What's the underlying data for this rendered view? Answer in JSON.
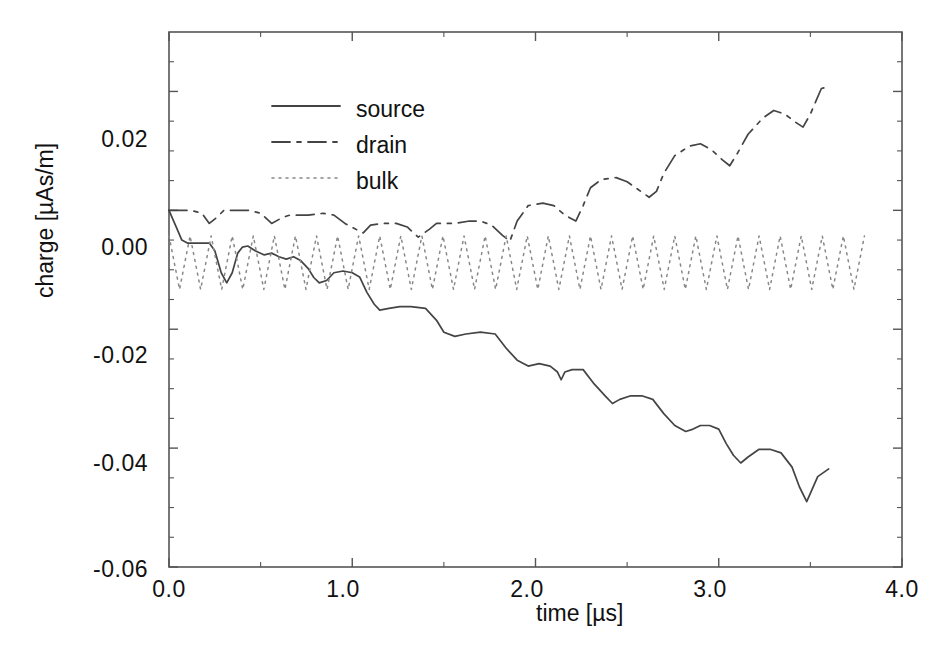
{
  "chart_data": {
    "type": "line",
    "title": "",
    "xlabel": "time [µs]",
    "ylabel": "charge [µAs/m]",
    "xlim": [
      0.0,
      4.0
    ],
    "ylim": [
      -0.06,
      0.03
    ],
    "xticks": [
      "0.0",
      "1.0",
      "2.0",
      "3.0",
      "4.0"
    ],
    "xtick_values": [
      0.0,
      1.0,
      2.0,
      3.0,
      4.0
    ],
    "yticks": [
      "0.02",
      "0.00",
      "-0.02",
      "-0.04",
      "-0.06"
    ],
    "ytick_values": [
      0.02,
      0.0,
      -0.02,
      -0.04,
      -0.06
    ],
    "minor_xtick_values": [
      0.5,
      1.5,
      2.5,
      3.5
    ],
    "minor_ytick_values": [
      0.025,
      0.015,
      0.01,
      0.005,
      -0.005,
      -0.01,
      -0.015,
      -0.025,
      -0.03,
      -0.035,
      -0.045,
      -0.05,
      -0.055
    ],
    "grid": false,
    "legend_position": "upper center",
    "frame_color": "#555555",
    "line_color": "#444444",
    "series": [
      {
        "name": "source",
        "label": "source",
        "style": "solid",
        "dasharray": "",
        "color": "#444444",
        "x": [
          0.0,
          0.035,
          0.07,
          0.1,
          0.22,
          0.25,
          0.285,
          0.315,
          0.345,
          0.375,
          0.4,
          0.43,
          0.47,
          0.52,
          0.56,
          0.6,
          0.64,
          0.68,
          0.72,
          0.76,
          0.79,
          0.82,
          0.86,
          0.9,
          0.95,
          1.0,
          1.04,
          1.08,
          1.12,
          1.15,
          1.2,
          1.26,
          1.32,
          1.4,
          1.46,
          1.5,
          1.56,
          1.62,
          1.7,
          1.78,
          1.84,
          1.9,
          1.96,
          2.02,
          2.08,
          2.12,
          2.14,
          2.16,
          2.2,
          2.26,
          2.32,
          2.38,
          2.42,
          2.46,
          2.52,
          2.58,
          2.64,
          2.7,
          2.76,
          2.82,
          2.86,
          2.9,
          2.95,
          3.0,
          3.04,
          3.08,
          3.12,
          3.16,
          3.22,
          3.28,
          3.34,
          3.4,
          3.44,
          3.48,
          3.54,
          3.6
        ],
        "y": [
          0.0,
          -0.0025,
          -0.005,
          -0.0055,
          -0.0055,
          -0.0068,
          -0.0105,
          -0.0122,
          -0.0105,
          -0.0072,
          -0.0062,
          -0.006,
          -0.0068,
          -0.0075,
          -0.0072,
          -0.0078,
          -0.0082,
          -0.0078,
          -0.0085,
          -0.0098,
          -0.0113,
          -0.0122,
          -0.0118,
          -0.0105,
          -0.0102,
          -0.0105,
          -0.0112,
          -0.0138,
          -0.0158,
          -0.0168,
          -0.0165,
          -0.0162,
          -0.0162,
          -0.0165,
          -0.0185,
          -0.0205,
          -0.0212,
          -0.0208,
          -0.0205,
          -0.0208,
          -0.0232,
          -0.0252,
          -0.0262,
          -0.0258,
          -0.0262,
          -0.0272,
          -0.0285,
          -0.0272,
          -0.0268,
          -0.0268,
          -0.0292,
          -0.0312,
          -0.0325,
          -0.0318,
          -0.0312,
          -0.0312,
          -0.0318,
          -0.0342,
          -0.0362,
          -0.0372,
          -0.0368,
          -0.0362,
          -0.0362,
          -0.0368,
          -0.0392,
          -0.0412,
          -0.0425,
          -0.0415,
          -0.0402,
          -0.0402,
          -0.0408,
          -0.0432,
          -0.0465,
          -0.049,
          -0.0448,
          -0.0435
        ]
      },
      {
        "name": "drain",
        "label": "drain",
        "style": "dashdot",
        "dasharray": "18 7 4 7",
        "color": "#444444",
        "x": [
          0.0,
          0.06,
          0.12,
          0.18,
          0.22,
          0.26,
          0.3,
          0.36,
          0.44,
          0.5,
          0.56,
          0.62,
          0.66,
          0.7,
          0.76,
          0.84,
          0.9,
          0.96,
          1.02,
          1.06,
          1.1,
          1.16,
          1.24,
          1.3,
          1.36,
          1.42,
          1.46,
          1.5,
          1.56,
          1.64,
          1.7,
          1.76,
          1.82,
          1.86,
          1.9,
          1.96,
          2.04,
          2.1,
          2.16,
          2.22,
          2.26,
          2.3,
          2.36,
          2.44,
          2.5,
          2.56,
          2.62,
          2.66,
          2.7,
          2.76,
          2.84,
          2.9,
          2.96,
          3.02,
          3.06,
          3.1,
          3.16,
          3.24,
          3.3,
          3.36,
          3.42,
          3.46,
          3.5,
          3.56,
          3.6
        ],
        "y": [
          0.0,
          0.0,
          0.0,
          -0.0005,
          -0.0022,
          -0.0012,
          0.0,
          0.0,
          0.0,
          -0.0005,
          -0.0022,
          -0.0012,
          -0.0008,
          -0.0008,
          -0.0008,
          -0.0005,
          -0.0008,
          -0.0022,
          -0.0032,
          -0.0038,
          -0.0025,
          -0.0022,
          -0.0022,
          -0.0028,
          -0.0045,
          -0.0032,
          -0.0022,
          -0.0022,
          -0.0022,
          -0.0018,
          -0.0018,
          -0.0025,
          -0.0042,
          -0.0052,
          -0.0018,
          0.0008,
          0.0012,
          0.0008,
          -0.0008,
          -0.0018,
          0.0008,
          0.0038,
          0.0052,
          0.0055,
          0.0048,
          0.0035,
          0.0022,
          0.0032,
          0.0062,
          0.0092,
          0.0108,
          0.0112,
          0.0102,
          0.0085,
          0.0075,
          0.0095,
          0.0128,
          0.0155,
          0.0168,
          0.0162,
          0.0148,
          0.014,
          0.0162,
          0.0205,
          0.0208
        ]
      },
      {
        "name": "bulk",
        "label": "bulk",
        "style": "dotted",
        "dasharray": "2 5",
        "color": "#888888",
        "x_start": 0.0,
        "x_end": 3.82,
        "baseline": -0.0088,
        "amplitude": 0.0045,
        "period": 0.115,
        "description": "steady sawtooth oscillation about -0.0088 between approximately -0.0043 and -0.0133"
      }
    ]
  },
  "legend": {
    "entries": [
      {
        "label": "source",
        "style": "solid"
      },
      {
        "label": "drain",
        "style": "dashdot"
      },
      {
        "label": "bulk",
        "style": "dotted"
      }
    ]
  }
}
